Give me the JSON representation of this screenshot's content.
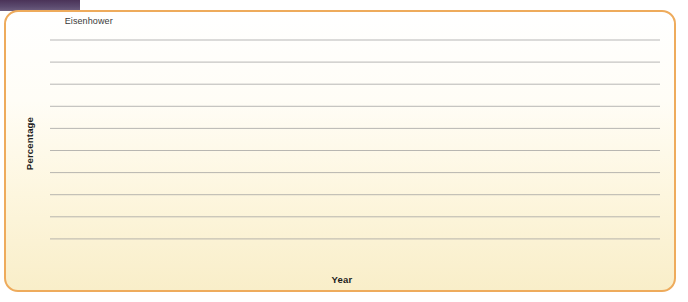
{
  "page": {
    "faint_header_text": "",
    "badge": "badge-strip"
  },
  "chart_data": {
    "type": "line",
    "title": "",
    "xlabel": "Year",
    "ylabel": "Percentage",
    "xlim": [
      1953,
      2016
    ],
    "ylim": [
      0,
      100
    ],
    "grid": true,
    "legend": "none",
    "line_color": "#4a6fb0",
    "x_tick_labels": [
      "1955",
      "1960",
      "1965",
      "1970",
      "1975",
      "1980",
      "1985",
      "1990",
      "1995",
      "2000",
      "2005",
      "2010",
      "2016"
    ],
    "x_tick_values": [
      1955,
      1960,
      1965,
      1970,
      1975,
      1980,
      1985,
      1990,
      1995,
      2000,
      2005,
      2010,
      2016
    ],
    "y_tick_labels": [
      "0",
      "10",
      "20",
      "30",
      "40",
      "50",
      "60",
      "70",
      "80",
      "90",
      "100"
    ],
    "y_tick_values": [
      0,
      10,
      20,
      30,
      40,
      50,
      60,
      70,
      80,
      90,
      100
    ],
    "x": [
      1953,
      1954,
      1955,
      1956,
      1957,
      1958,
      1959,
      1960,
      1961,
      1962,
      1963,
      1964,
      1965,
      1966,
      1967,
      1968,
      1969,
      1970,
      1971,
      1972,
      1973,
      1974,
      1975,
      1976,
      1977,
      1978,
      1979,
      1980,
      1981,
      1982,
      1983,
      1984,
      1985,
      1986,
      1987,
      1988,
      1989,
      1990,
      1991,
      1992,
      1993,
      1994,
      1995,
      1996,
      1997,
      1998,
      1999,
      2000,
      2001,
      2002,
      2003,
      2004,
      2005,
      2006,
      2007,
      2008,
      2009,
      2010,
      2011,
      2012,
      2013,
      2014,
      2015,
      2016
    ],
    "values": [
      88,
      83,
      77,
      71,
      69,
      68,
      52,
      69,
      72,
      77,
      80,
      87,
      94,
      85,
      77,
      76,
      76,
      76,
      74,
      72,
      64,
      49,
      57,
      58,
      53,
      62,
      75,
      76,
      78,
      79,
      83,
      77,
      72,
      67,
      62,
      43,
      57,
      60,
      44,
      56,
      84,
      84,
      84,
      76,
      66,
      58,
      36,
      46,
      63,
      75,
      84,
      75,
      79,
      73,
      75,
      78,
      88,
      96,
      74,
      71,
      68,
      73,
      60,
      39
    ],
    "annotations": []
  },
  "presidents": {
    "header_note": "presidential terms",
    "items": [
      {
        "label": "Eisenhower",
        "start": 1953,
        "end": 1961
      },
      {
        "label": "Kennedy",
        "start": 1961,
        "end": 1964
      },
      {
        "label": "Johnson",
        "start": 1964,
        "end": 1969
      },
      {
        "label": "Nixon",
        "start": 1969,
        "end": 1974
      },
      {
        "label": "Ford",
        "start": 1974,
        "end": 1977
      },
      {
        "label": "Carter",
        "start": 1977,
        "end": 1981
      },
      {
        "label": "Reagan",
        "start": 1981,
        "end": 1989
      },
      {
        "label": "Bush",
        "start": 1989,
        "end": 1993
      },
      {
        "label": "Clinton",
        "start": 1993,
        "end": 2001
      },
      {
        "label": "G. W. Bush",
        "start": 2001,
        "end": 2009
      },
      {
        "label": "Obama",
        "start": 2009,
        "end": 2016
      }
    ]
  }
}
